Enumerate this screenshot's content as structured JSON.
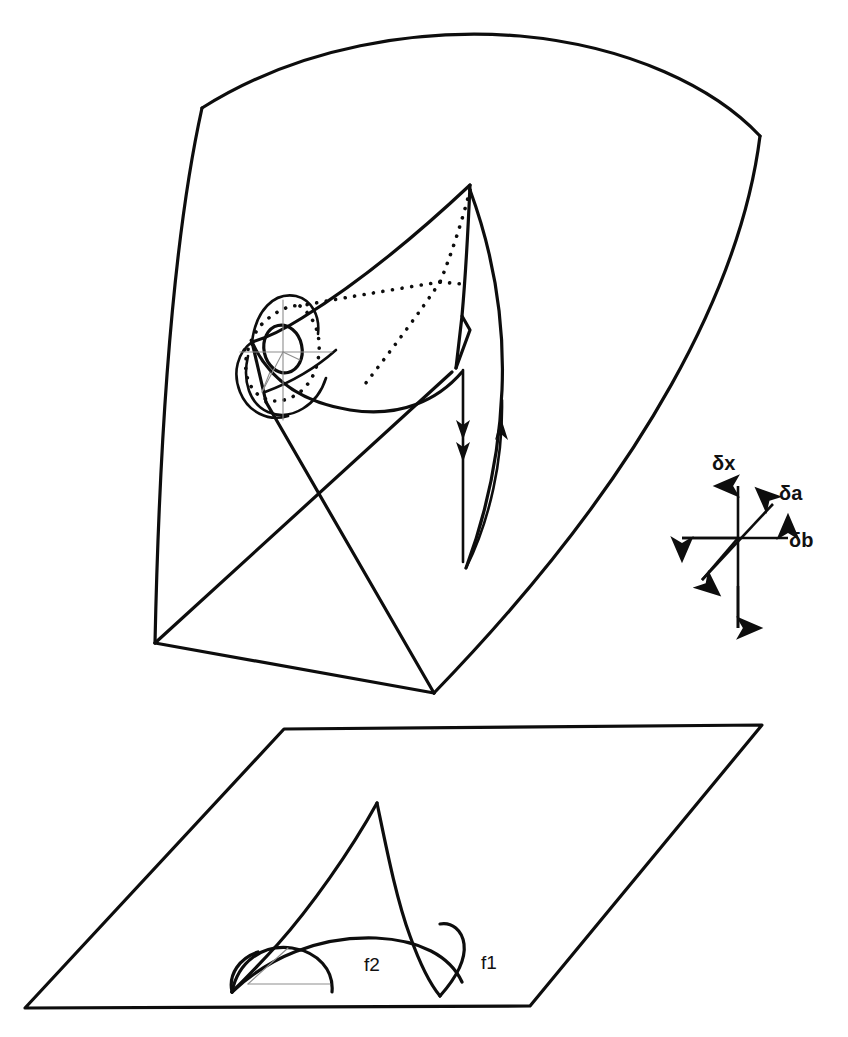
{
  "figure": {
    "kind": "line-diagram",
    "background_color": "#ffffff",
    "ink_color": "#0d0d0d",
    "hairline_color": "#8d8d8d",
    "width": 848,
    "height": 1037
  },
  "upper_panel": {
    "name": "swallowtail-surface-panel",
    "shield_corners": [
      {
        "x": 202,
        "y": 108
      },
      {
        "x": 760,
        "y": 136
      },
      {
        "x": 434,
        "y": 693
      },
      {
        "x": 155,
        "y": 643
      }
    ],
    "cusp_apex": {
      "x": 470,
      "y": 185
    },
    "leg_crossing": {
      "x": 320,
      "y": 485
    },
    "ellipse_center": {
      "x": 283,
      "y": 349
    },
    "ellipse_rx": 19,
    "ellipse_ry": 24
  },
  "lower_panel": {
    "name": "parameter-plane-panel",
    "parallelogram_corners": [
      {
        "x": 284,
        "y": 729
      },
      {
        "x": 762,
        "y": 725
      },
      {
        "x": 530,
        "y": 1006
      },
      {
        "x": 25,
        "y": 1008
      }
    ],
    "cusp_apex": {
      "x": 377,
      "y": 803
    },
    "labels": [
      {
        "id": "f2",
        "text": "f2",
        "x": 371,
        "y": 964
      },
      {
        "id": "f1",
        "text": "f1",
        "x": 487,
        "y": 962
      }
    ]
  },
  "fold_labels": {
    "f1": "f1",
    "f2": "f2"
  },
  "axis_legend": {
    "name": "coordinate-axes-legend",
    "origin": {
      "x": 738,
      "y": 538
    },
    "axes": [
      {
        "id": "delta-x",
        "label": "δx",
        "delta": "δ",
        "variable": "x",
        "direction": "vertical",
        "label_x": 716,
        "label_y": 469
      },
      {
        "id": "delta-a",
        "label": "δa",
        "delta": "δ",
        "variable": "a",
        "direction": "diagonal-up-right",
        "label_x": 779,
        "label_y": 497
      },
      {
        "id": "delta-b",
        "label": "δb",
        "delta": "δ",
        "variable": "b",
        "direction": "horizontal",
        "label_x": 788,
        "label_y": 546
      }
    ]
  },
  "flow_arrows": {
    "name": "flow-arrows",
    "descending_arrow_count": 2,
    "ascending_arrow_count": 1
  }
}
